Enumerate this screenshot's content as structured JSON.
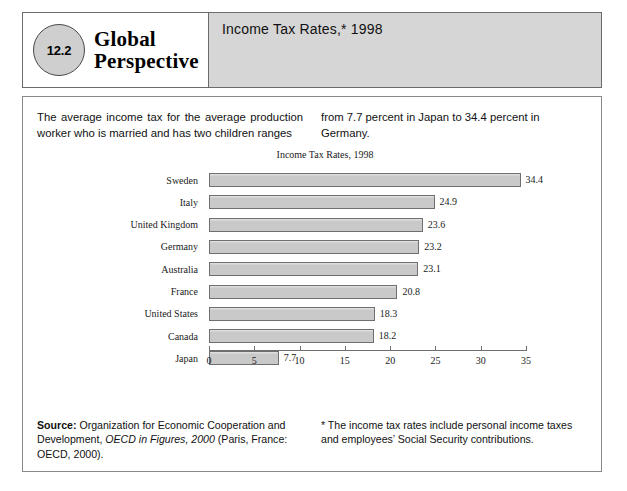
{
  "header": {
    "figure_number": "12.2",
    "logo_line1": "Global",
    "logo_line2": "Perspective",
    "banner_title": "Income Tax Rates,* 1998"
  },
  "intro": {
    "column1": "The average income tax for the average production worker who is married and has two children ranges",
    "column2": "from 7.7 percent in Japan to 34.4 percent in Germany."
  },
  "footnotes": {
    "source_label": "Source:",
    "source_text_1": " Organization for Economic Cooperation and Development, ",
    "source_italic": "OECD in Figures, 2000",
    "source_text_2": " (Paris, France: OECD, 2000).",
    "note": "* The income tax rates include personal income taxes and employees’ Social Security contributions."
  },
  "chart_data": {
    "type": "bar",
    "orientation": "horizontal",
    "title": "Income Tax Rates, 1998",
    "xlabel": "",
    "ylabel": "",
    "xlim": [
      0,
      35
    ],
    "xticks": [
      0,
      5,
      10,
      15,
      20,
      25,
      30,
      35
    ],
    "grid": false,
    "legend": false,
    "categories": [
      "Sweden",
      "Italy",
      "United Kingdom",
      "Germany",
      "Australia",
      "France",
      "United States",
      "Canada",
      "Japan"
    ],
    "values": [
      34.4,
      24.9,
      23.6,
      23.2,
      23.1,
      20.8,
      18.3,
      18.2,
      7.7
    ],
    "value_labels": [
      "34.4",
      "24.9",
      "23.6",
      "23.2",
      "23.1",
      "20.8",
      "18.3",
      "18.2",
      "7.7"
    ],
    "bar_fill": "#c9c9c9",
    "bar_border": "#6f6f6f"
  },
  "colors": {
    "banner_background": "#d6d6d6",
    "oval_fill": "#cfcfcf",
    "border": "#6b6b6b"
  }
}
